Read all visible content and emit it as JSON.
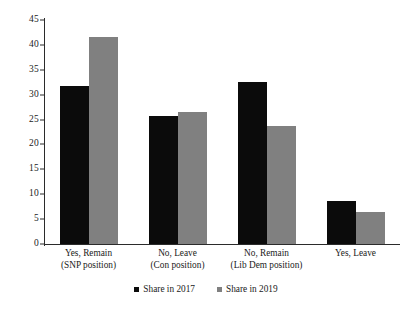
{
  "chart_data": {
    "type": "bar",
    "title": "",
    "subtitle": "",
    "xlabel": "",
    "ylabel": "",
    "ylim": [
      0,
      45
    ],
    "yticks": [
      0,
      5,
      10,
      15,
      20,
      25,
      30,
      35,
      40,
      45
    ],
    "grid": false,
    "legend_position": "bottom-center",
    "categories": [
      "Yes, Remain",
      "No, Leave",
      "No, Remain",
      "Yes, Leave"
    ],
    "category_sublabels": [
      "(SNP position)",
      "(Con position)",
      "(Lib Dem position)",
      ""
    ],
    "series": [
      {
        "name": "Share in 2017",
        "color": "#0b0b0b",
        "values": [
          31.8,
          25.8,
          32.5,
          8.7
        ]
      },
      {
        "name": "Share in 2019",
        "color": "#808080",
        "values": [
          41.5,
          26.6,
          23.7,
          6.4
        ]
      }
    ]
  },
  "legend": {
    "items": [
      {
        "label": "Share in 2017",
        "color": "#0b0b0b"
      },
      {
        "label": "Share in 2019",
        "color": "#808080"
      }
    ]
  },
  "colors": {
    "series_2017": "#0b0b0b",
    "series_2019": "#808080",
    "axis": "#2b2b2b",
    "text": "#1a1a1a",
    "background": "#ffffff"
  }
}
